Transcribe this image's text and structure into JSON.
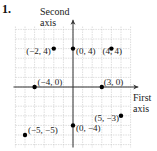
{
  "problem_number": "1.",
  "axes": {
    "y_label_line1": "Second",
    "y_label_line2": "axis",
    "x_label_line1": "First",
    "x_label_line2": "axis"
  },
  "colors": {
    "grid": "#c8c8c8",
    "axis": "#333333",
    "point": "#000000"
  },
  "points": [
    {
      "x": -2,
      "y": 4,
      "label": "(−2, 4)"
    },
    {
      "x": 0,
      "y": 4,
      "label": "(0, 4)"
    },
    {
      "x": 4,
      "y": 4,
      "label": "(4, 4)"
    },
    {
      "x": -4,
      "y": 0,
      "label": "(−4, 0)"
    },
    {
      "x": 3,
      "y": 0,
      "label": "(3, 0)"
    },
    {
      "x": 5,
      "y": -3,
      "label": "(5, −3)"
    },
    {
      "x": 0,
      "y": -4,
      "label": "(0, −4)"
    },
    {
      "x": -5,
      "y": -5,
      "label": "(−5, −5)"
    }
  ]
}
